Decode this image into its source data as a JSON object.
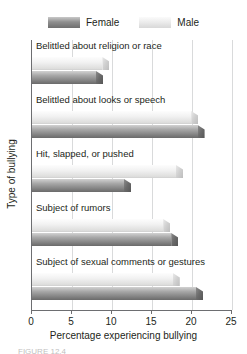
{
  "chart_data": {
    "type": "bar",
    "orientation": "horizontal",
    "title": "",
    "xlabel": "Percentage experiencing bullying",
    "ylabel": "Type of bullying",
    "xlim": [
      0,
      25
    ],
    "xticks": [
      0,
      5,
      10,
      15,
      20,
      25
    ],
    "xtick_labels": [
      "0",
      "5",
      "10",
      "15",
      "20",
      "25"
    ],
    "grid": "vertical",
    "legend_position": "top-center",
    "categories": [
      "Belittled about religion or race",
      "Belittled about looks or speech",
      "Hit, slapped, or pushed",
      "Subject of rumors",
      "Subject of sexual comments or gestures"
    ],
    "series": [
      {
        "name": "Female",
        "color": "#8f8f8f",
        "values": [
          8.0,
          20.7,
          11.5,
          17.4,
          20.5
        ]
      },
      {
        "name": "Male",
        "color": "#e8e8e8",
        "values": [
          8.8,
          19.9,
          18.0,
          16.4,
          17.6
        ]
      }
    ]
  },
  "legend": {
    "items": [
      {
        "label": "Female",
        "swatch": "female-swatch"
      },
      {
        "label": "Male",
        "swatch": "male-swatch"
      }
    ]
  },
  "caption": {
    "text": "FIGURE 12.4"
  }
}
